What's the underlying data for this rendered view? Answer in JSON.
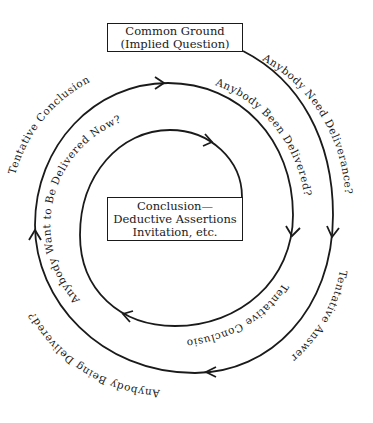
{
  "diagram": {
    "type": "spiral-flow",
    "top_box": {
      "line1": "Common Ground",
      "line2": "(Implied Question)"
    },
    "center_box": {
      "line1": "Conclusion—",
      "line2": "Deductive Assertions",
      "line3": "Invitation, etc."
    },
    "path_labels": {
      "outer_right": "Anybody Need Deliverance?",
      "outer_bottom": "Tentative Answer",
      "outer_left": "Anybody Being Delivered?",
      "outer_top_left": "Tentative Conclusion",
      "middle_right": "Anybody Been Delivered?",
      "middle_bottom": "Tentative Conclusions",
      "inner_left": "Anybody Want to Be Delivered Now?"
    },
    "colors": {
      "line": "#1a1a1a",
      "background": "#ffffff"
    }
  }
}
